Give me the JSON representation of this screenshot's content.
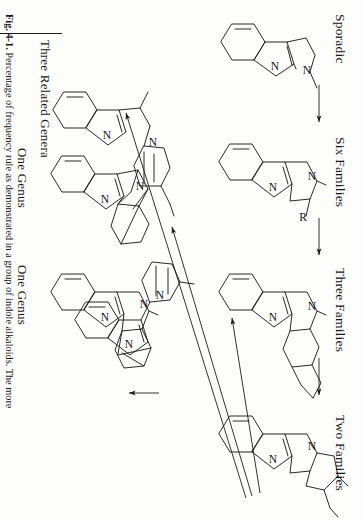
{
  "figure": {
    "number": "Fig. 4-1.",
    "caption_text": "Percentage of frequency rule as demonstrated in a group of indole alkaloids. The more",
    "ink_color": "#1c1c1c",
    "paper_color": "#fdfdfc"
  },
  "stage_labels": [
    {
      "id": "sporadic",
      "text": "Sporadic"
    },
    {
      "id": "six-families",
      "text": "Six Families"
    },
    {
      "id": "three-families",
      "text": "Three Families"
    },
    {
      "id": "two-families",
      "text": "Two Families"
    }
  ],
  "genus_labels": [
    {
      "id": "one-genus-upper",
      "text": "One Genus"
    },
    {
      "id": "one-genus-lower",
      "text": "One Genus"
    }
  ],
  "group_label": {
    "id": "three-related-genera",
    "text": "Three Related Genera"
  },
  "substituents": [
    {
      "id": "r-group",
      "text": "R"
    }
  ],
  "atom_labels": {
    "nitrogen": "N"
  },
  "structures": [
    {
      "id": "tryptamine",
      "stage": "Sporadic",
      "atoms": [
        "N",
        "N"
      ]
    },
    {
      "id": "corynanthe-tetracycle",
      "stage": "Six Families",
      "atoms": [
        "N",
        "N"
      ],
      "substituent": "R"
    },
    {
      "id": "yohimbane-pentacycle",
      "stage": "Three Families",
      "atoms": [
        "N",
        "N"
      ]
    },
    {
      "id": "corynantheine-type",
      "stage": "Two Families",
      "atoms": [
        "N",
        "N"
      ]
    },
    {
      "id": "bridged-genus-upper",
      "stage": "One Genus",
      "atoms": [
        "N",
        "N"
      ]
    },
    {
      "id": "bridged-genus-lower",
      "stage": "One Genus",
      "atoms": [
        "N",
        "N"
      ]
    },
    {
      "id": "related-genera-a",
      "stage": "Three Related Genera",
      "atoms": [
        "N",
        "N"
      ]
    },
    {
      "id": "related-genera-b",
      "stage": "Three Related Genera",
      "atoms": [
        "N",
        "N"
      ]
    }
  ],
  "arrows": [
    {
      "id": "arrow-sporadic-to-six",
      "kind": "straight"
    },
    {
      "id": "arrow-six-to-three",
      "kind": "straight"
    },
    {
      "id": "arrow-three-to-two",
      "kind": "straight"
    },
    {
      "id": "arrow-two-to-genus-upper",
      "kind": "diverging"
    },
    {
      "id": "arrow-two-to-genus-lower",
      "kind": "diverging"
    },
    {
      "id": "arrow-two-to-related-genera",
      "kind": "diverging"
    },
    {
      "id": "arrow-related-genera-internal",
      "kind": "straight"
    }
  ]
}
